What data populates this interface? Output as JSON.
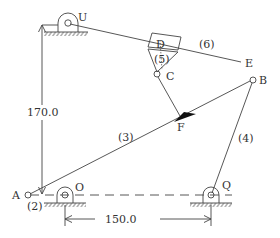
{
  "diagram": {
    "type": "planar linkage mechanism",
    "points": {
      "A": {
        "label": "A"
      },
      "B": {
        "label": "B"
      },
      "C": {
        "label": "C"
      },
      "D": {
        "label": "D"
      },
      "E": {
        "label": "E"
      },
      "F": {
        "label": "F"
      },
      "O": {
        "label": "O"
      },
      "Q": {
        "label": "Q"
      },
      "U": {
        "label": "U"
      }
    },
    "links": {
      "l2": "(2)",
      "l3": "(3)",
      "l4": "(4)",
      "l5": "(5)",
      "l6": "(6)"
    },
    "dimensions": {
      "vertical": "170.0",
      "horizontal": "150.0"
    },
    "colors": {
      "line": "#444444",
      "text": "#333333",
      "fill": "#111111"
    }
  }
}
